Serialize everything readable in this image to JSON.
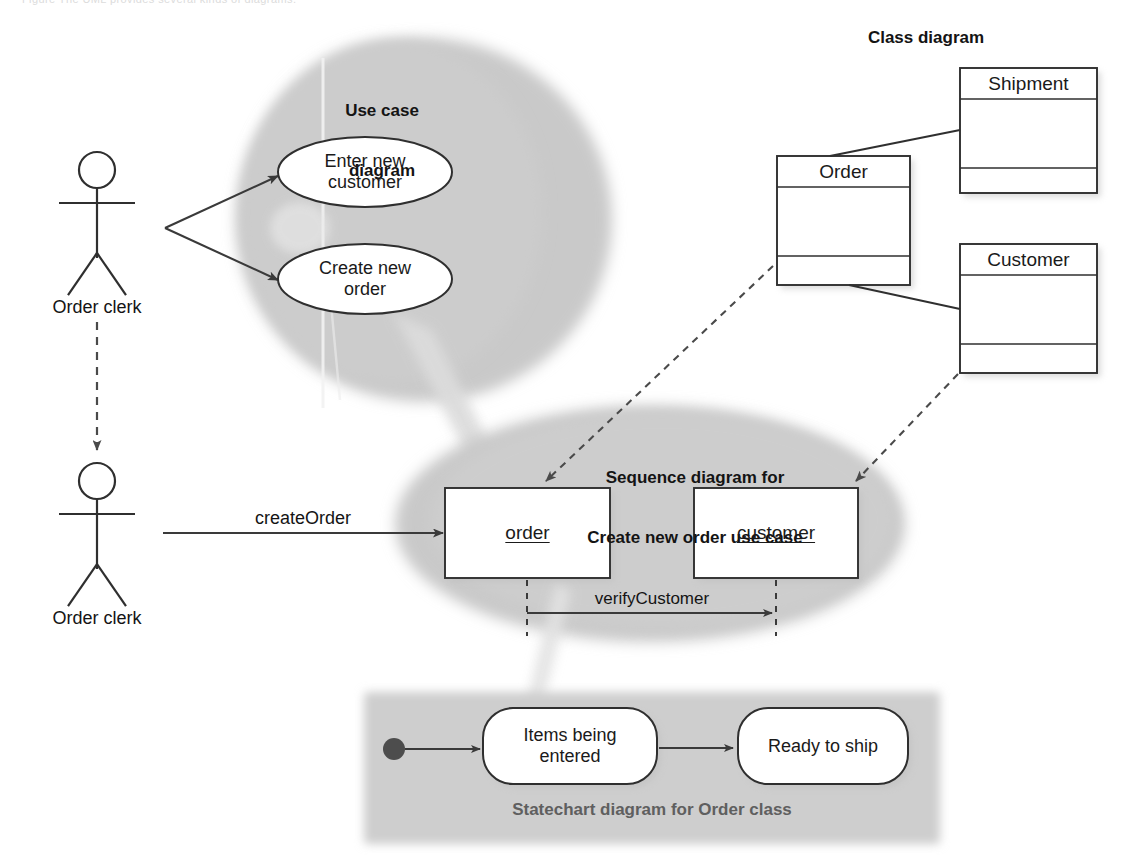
{
  "figure": {
    "top_caption": "Figure   The UML provides several kinds of diagrams.",
    "background": "#ffffff"
  },
  "colors": {
    "blob_fill": "#c9c9c9",
    "blob_fill_light": "#d2d2d2",
    "panel_fill": "#cfcfcf",
    "stroke": "#3a3a3a",
    "text": "#141414",
    "grey_arrow": "#d8d8d8",
    "shadow": "#b8b8b8",
    "white": "#ffffff",
    "statechart_label": "#5f5f5f"
  },
  "use_case_diagram": {
    "title": "Use case\ndiagram",
    "title_line1": "Use case",
    "title_line2": "diagram",
    "use_cases": [
      {
        "id": "uc-enter-new-customer",
        "label": "Enter new\ncustomer",
        "line1": "Enter new",
        "line2": "customer"
      },
      {
        "id": "uc-create-new-order",
        "label": "Create new\norder",
        "line1": "Create new",
        "line2": "order"
      }
    ],
    "actor": {
      "id": "actor-order-clerk-uc",
      "label": "Order clerk",
      "icon": "stick-figure-actor-icon"
    }
  },
  "class_diagram": {
    "title": "Class diagram",
    "classes": [
      {
        "id": "class-shipment",
        "name": "Shipment",
        "compartments": [
          "Shipment",
          "",
          ""
        ]
      },
      {
        "id": "class-order",
        "name": "Order",
        "compartments": [
          "Order",
          "",
          ""
        ]
      },
      {
        "id": "class-customer",
        "name": "Customer",
        "compartments": [
          "Customer",
          "",
          ""
        ]
      }
    ],
    "associations": [
      {
        "from": "Order",
        "to": "Shipment",
        "style": "solid"
      },
      {
        "from": "Order",
        "to": "Customer",
        "style": "solid"
      }
    ]
  },
  "sequence_diagram": {
    "title_line1": "Sequence diagram for",
    "title_line2": "Create new order use case",
    "title": "Sequence diagram for Create new order use case",
    "objects": [
      {
        "id": "object-order",
        "label": "order",
        "underlined": true
      },
      {
        "id": "object-customer",
        "label": "customer",
        "underlined": true
      }
    ],
    "messages": [
      {
        "id": "message-create-order",
        "label": "createOrder",
        "from": "Order clerk",
        "to": "order"
      },
      {
        "id": "message-verify-customer",
        "label": "verifyCustomer",
        "from": "order",
        "to": "customer"
      }
    ],
    "actor": {
      "id": "actor-order-clerk-seq",
      "label": "Order clerk",
      "icon": "stick-figure-actor-icon"
    }
  },
  "statechart_diagram": {
    "title": "Statechart diagram for Order class",
    "initial_state": {
      "id": "state-initial",
      "icon": "filled-circle-icon"
    },
    "states": [
      {
        "id": "state-items-being-entered",
        "label": "Items being\nentered",
        "line1": "Items being",
        "line2": "entered"
      },
      {
        "id": "state-ready-to-ship",
        "label": "Ready to ship",
        "line1": "Ready to ship",
        "line2": ""
      }
    ],
    "transitions": [
      {
        "from": "initial",
        "to": "Items being entered"
      },
      {
        "from": "Items being entered",
        "to": "Ready to ship"
      }
    ]
  },
  "traceability_links": [
    {
      "id": "link-order-class-to-order-object",
      "from": "Order class",
      "to": "order object",
      "style": "dashed-arrow"
    },
    {
      "id": "link-customer-class-to-customer-object",
      "from": "Customer class",
      "to": "customer object",
      "style": "dashed-arrow"
    },
    {
      "id": "link-actor-to-actor",
      "from": "Order clerk (use case)",
      "to": "Order clerk (sequence)",
      "style": "dashed-arrow"
    },
    {
      "id": "link-usecase-to-sequence",
      "from": "Use case diagram",
      "to": "Sequence diagram",
      "style": "grey-wedge"
    },
    {
      "id": "link-sequence-to-statechart",
      "from": "Sequence diagram",
      "to": "Statechart diagram",
      "style": "grey-wedge"
    }
  ]
}
